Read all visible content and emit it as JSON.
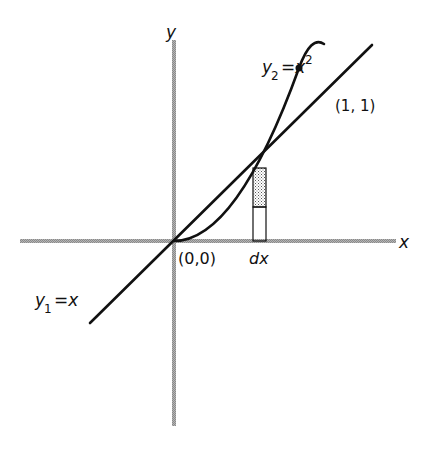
{
  "figure": {
    "axes": {
      "x_label": "x",
      "y_label": "y",
      "axis_color": "#9a9a9a"
    },
    "curves": [
      {
        "name": "line",
        "label_var": "y",
        "label_sub": "1",
        "label_rest": "=x",
        "equation": "y1 = x"
      },
      {
        "name": "parabola",
        "label_var": "y",
        "label_sub": "2",
        "label_rest": "=x",
        "label_sup": "2",
        "equation": "y2 = x^2"
      }
    ],
    "points": {
      "origin_label": "(0,0)",
      "intersection_label": "(1, 1)"
    },
    "strip": {
      "width_label": "dx",
      "fill": "stippled"
    },
    "colors": {
      "curve": "#111111",
      "axis": "#9a9a9a",
      "stipple": "#555555",
      "background": "#ffffff"
    }
  }
}
